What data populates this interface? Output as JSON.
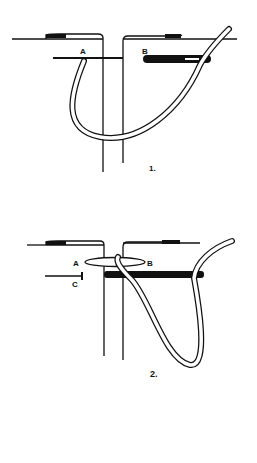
{
  "figures": [
    {
      "id": "figure-1",
      "number_label": "1.",
      "point_labels": {
        "a": "A",
        "b": "B"
      }
    },
    {
      "id": "figure-2",
      "number_label": "2.",
      "point_labels": {
        "a": "A",
        "b": "B",
        "c": "C"
      }
    }
  ],
  "colors": {
    "ink": "#111111",
    "background": "#ffffff"
  }
}
